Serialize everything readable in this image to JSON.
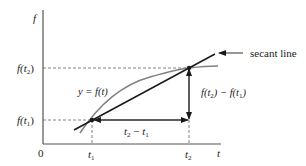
{
  "diagram": {
    "axes": {
      "y_label": "f",
      "x_label": "t",
      "origin_label": "0",
      "x_ticks": [
        {
          "label": "t",
          "sub": "1"
        },
        {
          "label": "t",
          "sub": "2"
        }
      ],
      "y_ticks": [
        {
          "label": "f(t",
          "sub": "1",
          "close": ")"
        },
        {
          "label": "f(t",
          "sub": "2",
          "close": ")"
        }
      ]
    },
    "curve_label": "y = f(t)",
    "secant_label": "secant line",
    "horizontal_difference": {
      "a": "t",
      "a_sub": "2",
      "op": " − ",
      "b": "t",
      "b_sub": "1"
    },
    "vertical_difference": {
      "a": "f(t",
      "a_sub": "2",
      "mid": ") − f(t",
      "b_sub": "1",
      "close": ")"
    },
    "colors": {
      "axis": "#555555",
      "curve": "#808080",
      "secant": "#1a1a1a",
      "dashed": "#666666",
      "arrows": "#1a1a1a"
    }
  }
}
